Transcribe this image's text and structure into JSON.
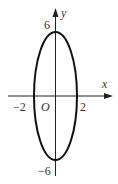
{
  "diagram": {
    "type": "ellipse-on-axes",
    "equation_hint": "x^2/4 + y^2/36 = 1",
    "axes": {
      "x_label": "x",
      "y_label": "y",
      "origin_label": "O"
    },
    "ticks": {
      "x_neg": "−2",
      "x_pos": "2",
      "y_pos": "6",
      "y_neg": "−6"
    },
    "colors": {
      "stroke": "#111111",
      "axis": "#222222",
      "text": "#333333"
    }
  }
}
